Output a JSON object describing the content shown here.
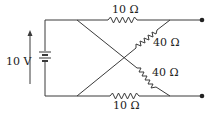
{
  "diagram": {
    "type": "circuit",
    "source": {
      "label": "10 V",
      "kind": "battery"
    },
    "resistors": [
      {
        "id": "top",
        "label": "10 Ω"
      },
      {
        "id": "diag-upper",
        "label": "40 Ω"
      },
      {
        "id": "diag-lower",
        "label": "40 Ω"
      },
      {
        "id": "bottom",
        "label": "10 Ω"
      }
    ],
    "terminals": [
      "top-right",
      "bottom-right"
    ]
  }
}
